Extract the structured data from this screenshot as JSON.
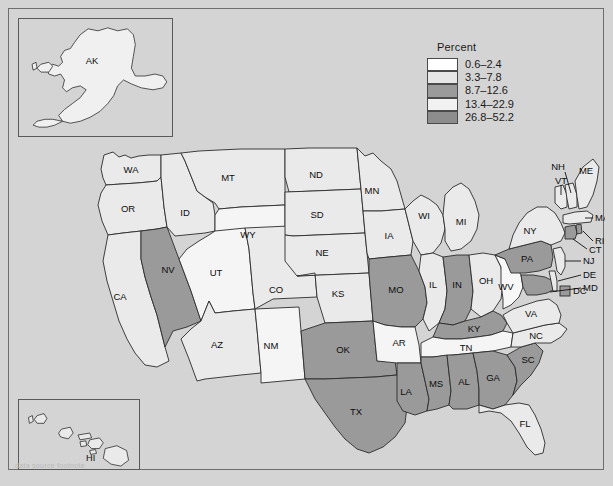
{
  "figure": {
    "background_color": "#d4d4d4",
    "border_color": "#6e6e6e",
    "caption": "data source footnote"
  },
  "legend": {
    "title": "Percent",
    "position": "top-right",
    "classes": [
      {
        "label": "0.6–2.4",
        "color": "#ffffff"
      },
      {
        "label": "3.3–7.8",
        "color": "#e6e6e6"
      },
      {
        "label": "8.7–12.6",
        "color": "#9a9a9a"
      },
      {
        "label": "13.4–22.9",
        "color": "#f2f2f2"
      },
      {
        "label": "26.8–52.2",
        "color": "#8d8d8d"
      }
    ]
  },
  "insets": [
    {
      "name": "alaska-inset",
      "label": "AK"
    },
    {
      "name": "hawaii-inset",
      "label": "HI"
    }
  ],
  "chart_data": {
    "type": "choropleth",
    "title": "",
    "value_label": "Percent",
    "legend_bins": [
      "0.6–2.4",
      "3.3–7.8",
      "8.7–12.6",
      "13.4–22.9",
      "26.8–52.2"
    ],
    "bin_colors": [
      "#ffffff",
      "#e6e6e6",
      "#9a9a9a",
      "#f2f2f2",
      "#8d8d8d"
    ],
    "regions": [
      {
        "code": "WA",
        "label": "WA",
        "bin": 1,
        "color": "#eaeaea"
      },
      {
        "code": "OR",
        "label": "OR",
        "bin": 1,
        "color": "#eaeaea"
      },
      {
        "code": "ID",
        "label": "ID",
        "bin": 1,
        "color": "#eaeaea"
      },
      {
        "code": "MT",
        "label": "MT",
        "bin": 1,
        "color": "#eaeaea"
      },
      {
        "code": "WY",
        "label": "WY",
        "bin": 0,
        "color": "#f5f5f5"
      },
      {
        "code": "NV",
        "label": "NV",
        "bin": 2,
        "color": "#9a9a9a"
      },
      {
        "code": "UT",
        "label": "UT",
        "bin": 0,
        "color": "#f5f5f5"
      },
      {
        "code": "CA",
        "label": "CA",
        "bin": 1,
        "color": "#eaeaea"
      },
      {
        "code": "AZ",
        "label": "AZ",
        "bin": 1,
        "color": "#eaeaea"
      },
      {
        "code": "NM",
        "label": "NM",
        "bin": 0,
        "color": "#f5f5f5"
      },
      {
        "code": "CO",
        "label": "CO",
        "bin": 1,
        "color": "#eaeaea"
      },
      {
        "code": "ND",
        "label": "ND",
        "bin": 1,
        "color": "#eaeaea"
      },
      {
        "code": "SD",
        "label": "SD",
        "bin": 1,
        "color": "#eaeaea"
      },
      {
        "code": "NE",
        "label": "NE",
        "bin": 1,
        "color": "#eaeaea"
      },
      {
        "code": "KS",
        "label": "KS",
        "bin": 1,
        "color": "#eaeaea"
      },
      {
        "code": "OK",
        "label": "OK",
        "bin": 2,
        "color": "#9a9a9a"
      },
      {
        "code": "TX",
        "label": "TX",
        "bin": 2,
        "color": "#9a9a9a"
      },
      {
        "code": "MN",
        "label": "MN",
        "bin": 1,
        "color": "#eaeaea"
      },
      {
        "code": "IA",
        "label": "IA",
        "bin": 1,
        "color": "#eaeaea"
      },
      {
        "code": "MO",
        "label": "MO",
        "bin": 2,
        "color": "#9a9a9a"
      },
      {
        "code": "AR",
        "label": "AR",
        "bin": 0,
        "color": "#f5f5f5"
      },
      {
        "code": "LA",
        "label": "LA",
        "bin": 2,
        "color": "#9a9a9a"
      },
      {
        "code": "WI",
        "label": "WI",
        "bin": 1,
        "color": "#eaeaea"
      },
      {
        "code": "IL",
        "label": "IL",
        "bin": 1,
        "color": "#eaeaea"
      },
      {
        "code": "MS",
        "label": "MS",
        "bin": 2,
        "color": "#9a9a9a"
      },
      {
        "code": "MI",
        "label": "MI",
        "bin": 1,
        "color": "#eaeaea"
      },
      {
        "code": "IN",
        "label": "IN",
        "bin": 2,
        "color": "#9a9a9a"
      },
      {
        "code": "OH",
        "label": "OH",
        "bin": 1,
        "color": "#eaeaea"
      },
      {
        "code": "KY",
        "label": "KY",
        "bin": 2,
        "color": "#9a9a9a"
      },
      {
        "code": "TN",
        "label": "TN",
        "bin": 0,
        "color": "#f5f5f5"
      },
      {
        "code": "AL",
        "label": "AL",
        "bin": 2,
        "color": "#9a9a9a"
      },
      {
        "code": "GA",
        "label": "GA",
        "bin": 2,
        "color": "#9a9a9a"
      },
      {
        "code": "FL",
        "label": "FL",
        "bin": 1,
        "color": "#eaeaea"
      },
      {
        "code": "SC",
        "label": "SC",
        "bin": 2,
        "color": "#9a9a9a"
      },
      {
        "code": "NC",
        "label": "NC",
        "bin": 1,
        "color": "#eaeaea"
      },
      {
        "code": "VA",
        "label": "VA",
        "bin": 1,
        "color": "#eaeaea"
      },
      {
        "code": "WV",
        "label": "WV",
        "bin": 0,
        "color": "#f7f7f7"
      },
      {
        "code": "MD",
        "label": "MD",
        "bin": 2,
        "color": "#9a9a9a"
      },
      {
        "code": "DE",
        "label": "DE",
        "bin": 1,
        "color": "#eaeaea"
      },
      {
        "code": "PA",
        "label": "PA",
        "bin": 2,
        "color": "#9a9a9a"
      },
      {
        "code": "NJ",
        "label": "NJ",
        "bin": 1,
        "color": "#eaeaea"
      },
      {
        "code": "NY",
        "label": "NY",
        "bin": 1,
        "color": "#eaeaea"
      },
      {
        "code": "CT",
        "label": "CT",
        "bin": 2,
        "color": "#9a9a9a"
      },
      {
        "code": "RI",
        "label": "RI",
        "bin": 2,
        "color": "#9a9a9a"
      },
      {
        "code": "MA",
        "label": "MA",
        "bin": 1,
        "color": "#eaeaea"
      },
      {
        "code": "VT",
        "label": "VT",
        "bin": 1,
        "color": "#eaeaea"
      },
      {
        "code": "NH",
        "label": "NH",
        "bin": 1,
        "color": "#eaeaea"
      },
      {
        "code": "ME",
        "label": "ME",
        "bin": 1,
        "color": "#eaeaea"
      },
      {
        "code": "DC",
        "label": "DC",
        "bin": 2,
        "color": "#9a9a9a"
      },
      {
        "code": "AK",
        "label": "AK",
        "bin": 0,
        "color": "#f0f0f0"
      },
      {
        "code": "HI",
        "label": "HI",
        "bin": 1,
        "color": "#eaeaea"
      }
    ]
  }
}
